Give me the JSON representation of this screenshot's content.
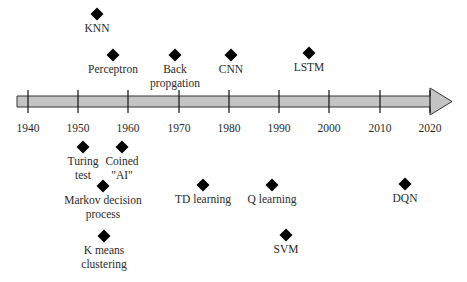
{
  "timeline": {
    "colors": {
      "bar_fill": "#c4c4c4",
      "bar_stroke": "#333333",
      "marker": "#000000",
      "text": "#2a2a2a"
    },
    "bar": {
      "x_start": 17,
      "x_end": 430,
      "y_top": 96,
      "y_bottom": 107,
      "head_tip_x": 452,
      "head_top": 88,
      "head_bottom": 115
    },
    "years": [
      {
        "label": "1940",
        "x": 28
      },
      {
        "label": "1950",
        "x": 78
      },
      {
        "label": "1960",
        "x": 128
      },
      {
        "label": "1970",
        "x": 179
      },
      {
        "label": "1980",
        "x": 229
      },
      {
        "label": "1990",
        "x": 279
      },
      {
        "label": "2000",
        "x": 329
      },
      {
        "label": "2010",
        "x": 380
      },
      {
        "label": "2020",
        "x": 430
      }
    ],
    "events": [
      {
        "name": "knn",
        "lines": [
          "KNN"
        ],
        "x": 97,
        "y": 14
      },
      {
        "name": "perceptron",
        "lines": [
          "Perceptron"
        ],
        "x": 113,
        "y": 55
      },
      {
        "name": "back-propagation",
        "lines": [
          "Back",
          "propgation"
        ],
        "x": 175,
        "y": 55
      },
      {
        "name": "cnn",
        "lines": [
          "CNN"
        ],
        "x": 231,
        "y": 55
      },
      {
        "name": "lstm",
        "lines": [
          "LSTM"
        ],
        "x": 309,
        "y": 53
      },
      {
        "name": "turing-test",
        "lines": [
          "Turing",
          "test"
        ],
        "x": 83,
        "y": 147
      },
      {
        "name": "coined-ai",
        "lines": [
          "Coined",
          "\"AI\""
        ],
        "x": 122,
        "y": 147
      },
      {
        "name": "markov-decision-process",
        "lines": [
          "Markov decision",
          "process"
        ],
        "x": 103,
        "y": 186
      },
      {
        "name": "td-learning",
        "lines": [
          "TD learning"
        ],
        "x": 203,
        "y": 185
      },
      {
        "name": "q-learning",
        "lines": [
          "Q learning"
        ],
        "x": 272,
        "y": 185
      },
      {
        "name": "dqn",
        "lines": [
          "DQN"
        ],
        "x": 405,
        "y": 184
      },
      {
        "name": "k-means-clustering",
        "lines": [
          "K means",
          "clustering"
        ],
        "x": 104,
        "y": 236
      },
      {
        "name": "svm",
        "lines": [
          "SVM"
        ],
        "x": 286,
        "y": 235
      }
    ]
  }
}
